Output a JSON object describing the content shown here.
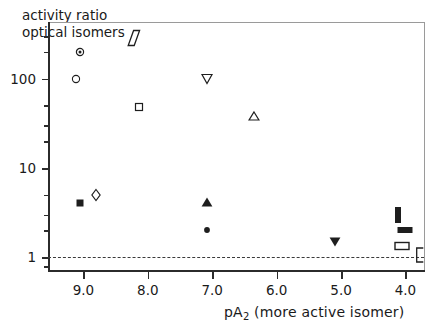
{
  "figure": {
    "title_line1": "activity ratio",
    "title_line2": "optical isomers",
    "stroke_color": "#2b2b2b",
    "frame_light_color": "#9a9a9a"
  },
  "chart_data": {
    "type": "scatter",
    "title": "activity ratio optical isomers",
    "xlabel": "pA2 (more active isomer)",
    "xlabel_text": "pA",
    "xlabel_sub": "2",
    "xlabel_tail": " (more active isomer)",
    "ylabel": "activity ratio optical isomers",
    "xlim": [
      9.55,
      3.72
    ],
    "ylim": [
      0.72,
      430
    ],
    "yscale": "log",
    "xscale": "linear",
    "x_reversed": true,
    "grid": false,
    "legend": "none",
    "xticks": [
      9.0,
      8.0,
      7.0,
      6.0,
      5.0,
      4.0
    ],
    "xticklabels": [
      "9.0",
      "8.0",
      "7.0",
      "6.0",
      "5.0",
      "4.0"
    ],
    "yticks": [
      1,
      10,
      100
    ],
    "yticklabels": [
      "1",
      "10",
      "100"
    ],
    "y_minor_ticks": [
      0.8,
      2,
      3,
      5,
      20,
      30,
      50,
      200,
      300
    ],
    "reference_line": {
      "y": 1,
      "style": "dashed",
      "label": "1"
    },
    "points": [
      {
        "marker": "circle-dot",
        "x": 9.05,
        "y": 200,
        "filled": false
      },
      {
        "marker": "circle-open",
        "x": 9.12,
        "y": 100,
        "filled": false
      },
      {
        "marker": "parallelogram-open",
        "x": 8.22,
        "y": 285,
        "filled": false
      },
      {
        "marker": "square-open",
        "x": 8.13,
        "y": 48,
        "filled": false
      },
      {
        "marker": "square-filled",
        "x": 9.05,
        "y": 4.0,
        "filled": true
      },
      {
        "marker": "diamond-open",
        "x": 8.8,
        "y": 5.0,
        "filled": false
      },
      {
        "marker": "triangle-down-open",
        "x": 7.08,
        "y": 100,
        "filled": false
      },
      {
        "marker": "triangle-up-open",
        "x": 6.35,
        "y": 38,
        "filled": false
      },
      {
        "marker": "triangle-up-filled",
        "x": 7.08,
        "y": 4.2,
        "filled": true
      },
      {
        "marker": "circle-filled",
        "x": 7.08,
        "y": 2.0,
        "filled": true
      },
      {
        "marker": "triangle-down-filled",
        "x": 5.1,
        "y": 1.5,
        "filled": true
      },
      {
        "marker": "bar-vertical-filled",
        "x": 4.12,
        "y": 3.0,
        "filled": true
      },
      {
        "marker": "bar-horizontal-filled",
        "x": 4.0,
        "y": 2.0,
        "filled": true
      },
      {
        "marker": "rect-open",
        "x": 4.05,
        "y": 1.35,
        "filled": false
      },
      {
        "marker": "bracket-open",
        "x": 3.78,
        "y": 1.05,
        "filled": false
      }
    ]
  }
}
